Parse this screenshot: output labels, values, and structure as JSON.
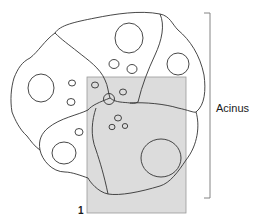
{
  "diagram": {
    "type": "histology-schematic",
    "labels": {
      "acinus": "Acinus",
      "marker_1": "1"
    },
    "elements": {
      "cells": 6,
      "highlight_region": "shaded rectangle labeled 1"
    },
    "colors": {
      "outline": "#333333",
      "shade": "#dcdcdc",
      "shade_border": "#9a9a9a",
      "bracket": "#777777"
    }
  }
}
